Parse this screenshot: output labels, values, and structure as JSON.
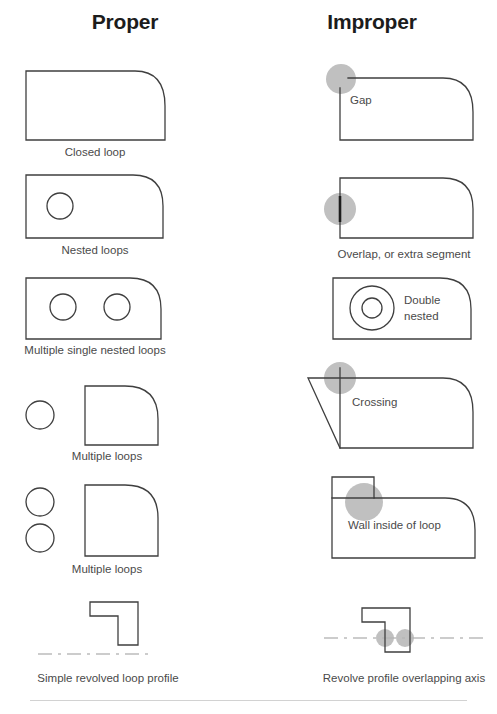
{
  "headers": {
    "proper": "Proper",
    "improper": "Improper"
  },
  "colors": {
    "outline": "#3f3f3f",
    "outline_thick": "#1d1d1d",
    "highlight_circle": "#b5b5b5",
    "axis_line": "#9a9a9a",
    "caption_text": "#4a4a4a",
    "header_text": "#1c1c1c",
    "background": "#ffffff"
  },
  "rows": [
    {
      "proper": {
        "name": "closed-loop",
        "caption": "Closed loop",
        "description": "Single closed rectangular profile with rounded top-right corner"
      },
      "improper": {
        "name": "gap",
        "caption": "",
        "inline_label": "Gap",
        "description": "Profile with a gap at the top-left corner, marked by a gray highlight circle"
      }
    },
    {
      "proper": {
        "name": "nested-loops",
        "caption": "Nested loops",
        "description": "Closed profile containing one interior circle"
      },
      "improper": {
        "name": "overlap-or-extra-segment",
        "caption": "Overlap, or extra segment",
        "description": "Profile with a doubled/overlapping segment on the left edge, marked by a gray highlight circle"
      }
    },
    {
      "proper": {
        "name": "multiple-single-nested-loops",
        "caption": "Multiple single nested loops",
        "description": "Closed profile containing two separate interior circles"
      },
      "improper": {
        "name": "double-nested",
        "caption": "",
        "inline_label_line1": "Double",
        "inline_label_line2": "nested",
        "description": "Profile containing two concentric circles, one inside the other"
      }
    },
    {
      "proper": {
        "name": "multiple-loops-one-circle",
        "caption": "Multiple loops",
        "description": "Closed profile alongside one separate circle outside of it"
      },
      "improper": {
        "name": "crossing",
        "caption": "",
        "inline_label": "Crossing",
        "description": "Profile whose edges extend past the top-left corner and cross, marked by a gray highlight circle"
      }
    },
    {
      "proper": {
        "name": "multiple-loops-two-circles",
        "caption": "Multiple loops",
        "description": "Closed profile alongside two separate circles outside of it"
      },
      "improper": {
        "name": "wall-inside-of-loop",
        "caption": "",
        "inline_label": "Wall inside of loop",
        "description": "Profile with a protruding box on top and an internal dividing wall line, marked by a gray highlight circle"
      }
    },
    {
      "proper": {
        "name": "simple-revolved-loop-profile",
        "caption": "Simple revolved loop profile",
        "description": "L-shaped profile positioned entirely above a dash-dot revolve axis"
      },
      "improper": {
        "name": "revolve-profile-overlapping-axis",
        "caption": "Revolve profile overlapping axis",
        "description": "L-shaped profile straddling the dash-dot revolve axis, with two gray highlight circles at the crossings"
      }
    }
  ]
}
